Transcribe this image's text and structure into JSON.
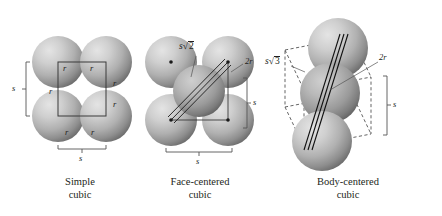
{
  "figure": {
    "background_color": "#ffffff",
    "ink_color": "#231f20",
    "sphere_light": "#d9d9d9",
    "sphere_dark": "#6e6e6e"
  },
  "panels": [
    {
      "id": "simple-cubic",
      "caption_line1": "Simple",
      "caption_line2": "cubic",
      "sphere_count": 4,
      "labels": {
        "edge_vertical": "s",
        "edge_horizontal": "s",
        "radius": "r",
        "radius_count": 6
      }
    },
    {
      "id": "face-centered-cubic",
      "caption_line1": "Face-centered",
      "caption_line2": "cubic",
      "sphere_count": 5,
      "labels": {
        "face_diagonal_base": "s",
        "face_diagonal_radicand": "2",
        "diameter": "2r",
        "edge_vertical": "s",
        "edge_horizontal": "s"
      }
    },
    {
      "id": "body-centered-cubic",
      "caption_line1": "Body-centered",
      "caption_line2": "cubic",
      "sphere_count": 3,
      "labels": {
        "body_diagonal_base": "s",
        "body_diagonal_radicand": "3",
        "diameter": "2r",
        "edge_vertical": "s"
      }
    }
  ]
}
